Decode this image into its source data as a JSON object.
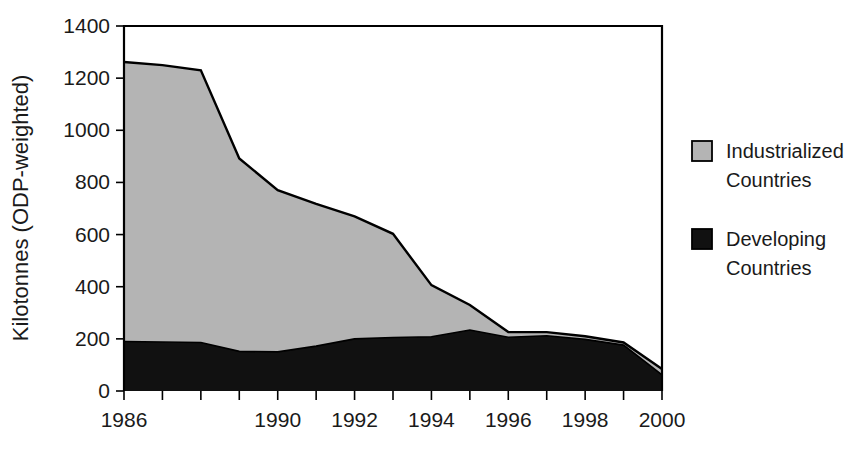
{
  "chart_data": {
    "type": "area",
    "stacked": true,
    "title": "",
    "subtitle": "",
    "xlabel": "",
    "ylabel": "Kilotonnes (ODP-weighted)",
    "x": [
      1986,
      1987,
      1988,
      1989,
      1990,
      1991,
      1992,
      1993,
      1994,
      1995,
      1996,
      1997,
      1998,
      1999,
      2000
    ],
    "xlim": [
      1986,
      2000
    ],
    "ylim": [
      0,
      1400
    ],
    "yticks": [
      0,
      200,
      400,
      600,
      800,
      1000,
      1200,
      1400
    ],
    "ytick_labels": [
      "0",
      "200",
      "400",
      "600",
      "800",
      "1000",
      "1200",
      "1400"
    ],
    "xticks": [
      1986,
      1987,
      1988,
      1989,
      1990,
      1991,
      1992,
      1993,
      1994,
      1995,
      1996,
      1997,
      1998,
      1999,
      2000
    ],
    "xtick_labels": [
      "1986",
      "",
      "",
      "",
      "1990",
      "",
      "1992",
      "",
      "1994",
      "",
      "1996",
      "",
      "1998",
      "",
      "2000"
    ],
    "grid": false,
    "legend_position": "right",
    "series": [
      {
        "name": "Developing Countries",
        "color": "#111111",
        "stack_order": 0,
        "values": [
          190,
          188,
          186,
          152,
          150,
          172,
          200,
          205,
          208,
          234,
          206,
          212,
          198,
          176,
          62
        ]
      },
      {
        "name": "Industrialized Countries",
        "color": "#b4b4b4",
        "stack_order": 1,
        "values": [
          1072,
          1062,
          1044,
          740,
          620,
          546,
          470,
          398,
          198,
          96,
          20,
          14,
          12,
          10,
          22
        ]
      }
    ],
    "totals": [
      1262,
      1250,
      1230,
      892,
      770,
      718,
      670,
      603,
      406,
      330,
      226,
      226,
      210,
      186,
      84
    ]
  },
  "legend": {
    "entries": [
      {
        "label_line1": "Industrialized",
        "label_line2": "Countries",
        "color": "#b4b4b4"
      },
      {
        "label_line1": "Developing",
        "label_line2": "Countries",
        "color": "#111111"
      }
    ]
  }
}
